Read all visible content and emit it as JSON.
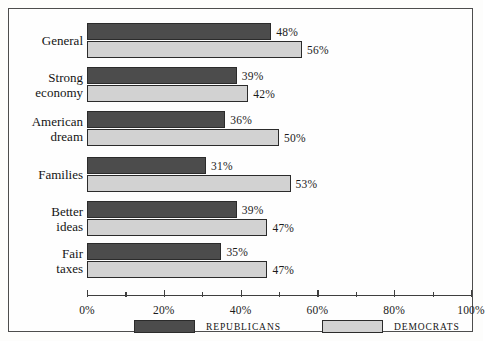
{
  "chart_data": {
    "type": "bar",
    "orientation": "horizontal",
    "title": "",
    "subtitle": "",
    "xlabel": "",
    "ylabel": "",
    "xlim": [
      0,
      100
    ],
    "grid": false,
    "legend_position": "bottom",
    "categories": [
      "General",
      "Strong economy",
      "American dream",
      "Families",
      "Better ideas",
      "Fair taxes"
    ],
    "category_lines": [
      [
        "General"
      ],
      [
        "Strong",
        "economy"
      ],
      [
        "American",
        "dream"
      ],
      [
        "Families"
      ],
      [
        "Better",
        "ideas"
      ],
      [
        "Fair",
        "taxes"
      ]
    ],
    "series": [
      {
        "name": "Republicans",
        "color": "#4c4c4c",
        "values": [
          48,
          39,
          36,
          31,
          39,
          35
        ],
        "value_labels": [
          "48%",
          "39%",
          "36%",
          "31%",
          "39%",
          "35%"
        ]
      },
      {
        "name": "Democrats",
        "color": "#d2d2d2",
        "values": [
          56,
          42,
          50,
          53,
          47,
          47
        ],
        "value_labels": [
          "56%",
          "42%",
          "50%",
          "53%",
          "47%",
          "47%"
        ]
      }
    ],
    "x_major_ticks": [
      0,
      20,
      40,
      60,
      80,
      100
    ],
    "x_major_tick_labels": [
      "0%",
      "20%",
      "40%",
      "60%",
      "80%",
      "100%"
    ],
    "x_minor_ticks": [
      10,
      30,
      50,
      70,
      90
    ]
  },
  "legend": {
    "items": [
      {
        "label": "REPUBLICANS",
        "color": "#4c4c4c"
      },
      {
        "label": "DEMOCRATS",
        "color": "#d2d2d2"
      }
    ]
  }
}
